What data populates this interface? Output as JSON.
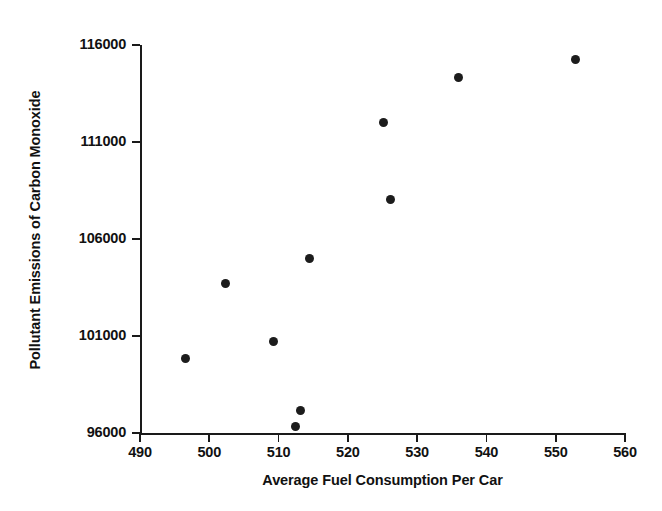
{
  "chart_data": {
    "type": "scatter",
    "title": "",
    "xlabel": "Average Fuel Consumption Per Car",
    "ylabel": "Pollutant Emissions of Carbon Monoxide",
    "xlim": [
      487,
      562
    ],
    "ylim": [
      95500,
      116500
    ],
    "xticks": [
      490,
      500,
      510,
      520,
      530,
      540,
      550,
      560
    ],
    "xtick_labels": [
      "490",
      "500",
      "510",
      "520",
      "530",
      "540",
      "550",
      "560"
    ],
    "yticks": [
      96000,
      101000,
      106000,
      111000,
      116000
    ],
    "ytick_labels": [
      "96000",
      "101000",
      "106000",
      "111000",
      "116000"
    ],
    "grid": false,
    "legend": null,
    "marker": {
      "shape": "filled-circle",
      "color": "#1c1c1c",
      "size_px": 9
    },
    "points": [
      {
        "x": 496.5,
        "y": 99850
      },
      {
        "x": 502.4,
        "y": 103700
      },
      {
        "x": 509.2,
        "y": 100700
      },
      {
        "x": 512.4,
        "y": 96350
      },
      {
        "x": 513.2,
        "y": 97150
      },
      {
        "x": 514.4,
        "y": 105000
      },
      {
        "x": 525.2,
        "y": 112000
      },
      {
        "x": 526.2,
        "y": 108050
      },
      {
        "x": 536.0,
        "y": 114300
      },
      {
        "x": 552.8,
        "y": 115250
      }
    ]
  },
  "figure": {
    "background": "#ffffff",
    "axis_color": "#1a1a1a"
  }
}
